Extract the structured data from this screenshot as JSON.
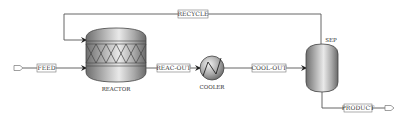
{
  "diagram": {
    "type": "process-flow-diagram",
    "units": [
      {
        "id": "reactor",
        "label": "REACTOR",
        "kind": "packed-reactor"
      },
      {
        "id": "cooler",
        "label": "COOLER",
        "kind": "heat-exchanger"
      },
      {
        "id": "sep",
        "label": "SEP",
        "kind": "flash-separator"
      }
    ],
    "streams": [
      {
        "id": "feed",
        "label": "FEED",
        "from": "inlet",
        "to": "reactor"
      },
      {
        "id": "reac_out",
        "label": "REAC-OUT",
        "from": "reactor",
        "to": "cooler"
      },
      {
        "id": "cool_out",
        "label": "COOL-OUT",
        "from": "cooler",
        "to": "sep"
      },
      {
        "id": "recycle",
        "label": "RECYCLE",
        "from": "sep",
        "to": "reactor"
      },
      {
        "id": "product",
        "label": "PRODUCT",
        "from": "sep",
        "to": "outlet"
      }
    ],
    "colors": {
      "line": "#555555",
      "vessel_dark": "#7a7a7a",
      "vessel_light": "#e6e6e6",
      "label_box_border": "#777777"
    }
  }
}
